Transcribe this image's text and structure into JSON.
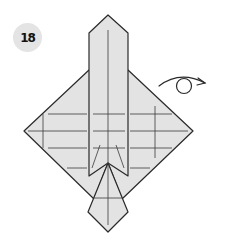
{
  "step": {
    "number": "18"
  },
  "symbols": {
    "turn_over": "turn-over-arrow"
  },
  "colors": {
    "paper_fill": "#e3e3e3",
    "edge_stroke": "#2a2a2a",
    "crease_stroke": "#3a3a3a",
    "badge_fill": "#e4e4e4",
    "badge_text": "#111111",
    "background": "#ffffff"
  }
}
